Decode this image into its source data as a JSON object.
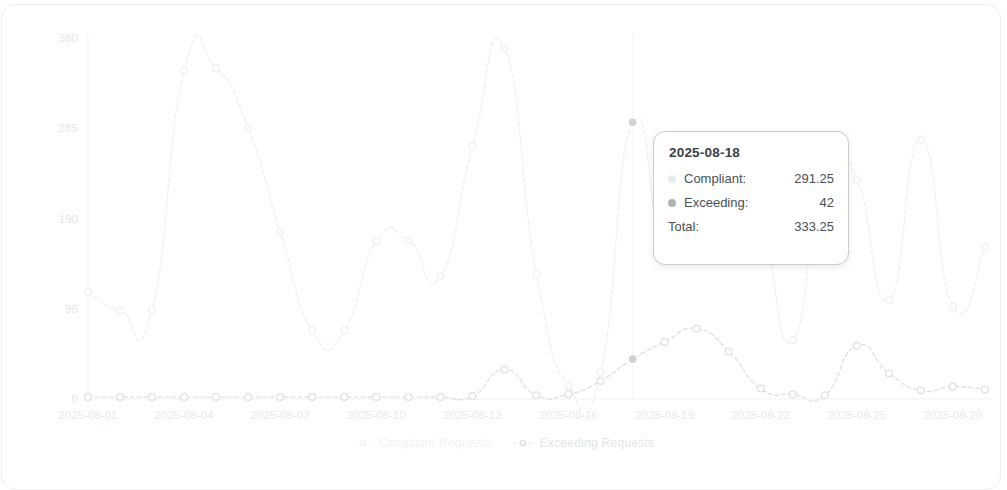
{
  "chart_data": {
    "type": "line",
    "title": "",
    "xlabel": "",
    "ylabel": "",
    "ylim": [
      0,
      380
    ],
    "yticks": [
      "0",
      "95",
      "190",
      "285",
      "380"
    ],
    "grid": false,
    "legend_position": "bottom",
    "x": [
      "2025-08-01",
      "2025-08-02",
      "2025-08-03",
      "2025-08-04",
      "2025-08-05",
      "2025-08-06",
      "2025-08-07",
      "2025-08-08",
      "2025-08-09",
      "2025-08-10",
      "2025-08-11",
      "2025-08-12",
      "2025-08-13",
      "2025-08-14",
      "2025-08-15",
      "2025-08-16",
      "2025-08-17",
      "2025-08-18",
      "2025-08-19",
      "2025-08-20",
      "2025-08-21",
      "2025-08-22",
      "2025-08-23",
      "2025-08-24",
      "2025-08-25",
      "2025-08-26",
      "2025-08-27",
      "2025-08-28",
      "2025-08-29"
    ],
    "xtick_labels": [
      "2025-08-01",
      "2025-08-04",
      "2025-08-07",
      "2025-08-10",
      "2025-08-13",
      "2025-08-16",
      "2025-08-19",
      "2025-08-22",
      "2025-08-25",
      "2025-08-28"
    ],
    "xtick_indices": [
      0,
      3,
      6,
      9,
      12,
      15,
      18,
      21,
      24,
      27
    ],
    "series": [
      {
        "name": "Compliant Requests",
        "color": "#eef0f1",
        "values": [
          112,
          93,
          94,
          346,
          348,
          285,
          176,
          72,
          72,
          166,
          167,
          129,
          266,
          369,
          131,
          14,
          28,
          291.25,
          152,
          176,
          147,
          176,
          62,
          253,
          231,
          104,
          273,
          97,
          160
        ]
      },
      {
        "name": "Exceeding Requests",
        "color": "#dfe2e4",
        "values": [
          2,
          2,
          2,
          2,
          2,
          2,
          2,
          2,
          2,
          2,
          2,
          2,
          3,
          31,
          4,
          5,
          19,
          42,
          60,
          74,
          50,
          11,
          5,
          4,
          56,
          27,
          9,
          13,
          10
        ]
      }
    ]
  },
  "tooltip": {
    "date": "2025-08-18",
    "rows": [
      {
        "label": "Compliant:",
        "value": "291.25",
        "series": "compliant"
      },
      {
        "label": "Exceeding:",
        "value": "42",
        "series": "exceeding"
      }
    ],
    "total_label": "Total:",
    "total_value": "333.25"
  },
  "legend": {
    "items": [
      {
        "label": "Compliant Requests",
        "key": "compliant"
      },
      {
        "label": "Exceeding Requests",
        "key": "exceeding"
      }
    ]
  },
  "colors": {
    "compliant": "#eef0f1",
    "exceeding": "#dfe2e4",
    "axis": "#f0f2f3",
    "tooltip_border": "#c9ccd1",
    "card_border": "#eceef0"
  }
}
